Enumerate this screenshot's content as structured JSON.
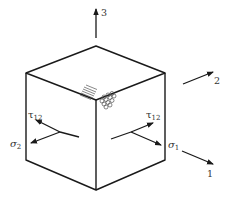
{
  "diagram": {
    "type": "orthotropic-lamina-cube",
    "axes": [
      {
        "id": "axis-1",
        "label": "1"
      },
      {
        "id": "axis-2",
        "label": "2"
      },
      {
        "id": "axis-3",
        "label": "3"
      }
    ],
    "stresses": {
      "sigma1": {
        "symbol": "σ",
        "subscript": "1"
      },
      "sigma2": {
        "symbol": "σ",
        "subscript": "2"
      },
      "tau12_left": {
        "symbol": "τ",
        "subscript": "12"
      },
      "tau12_right": {
        "symbol": "τ",
        "subscript": "12"
      }
    },
    "colors": {
      "line": "#1a1a1a",
      "text": "#333333",
      "background": "#ffffff"
    }
  }
}
